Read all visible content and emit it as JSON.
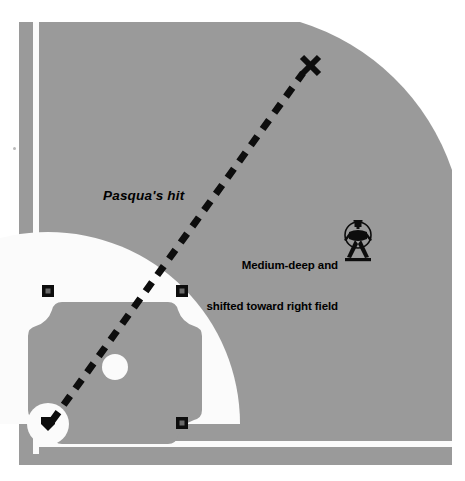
{
  "diagram": {
    "type": "baseball-spray-diagram",
    "width": 465,
    "height": 481
  },
  "colors": {
    "page_background": "#ffffff",
    "field_gray": "#9a9a9a",
    "field_gray_dark": "#949494",
    "chalk_white": "#f5f5f5",
    "dirt_white": "#fbfbfb",
    "ink_black": "#0d0d0d",
    "base_center": "#5a5a5a"
  },
  "labels": {
    "hit": "Pasqua's hit",
    "fielder_position_line1": "Medium-deep and",
    "fielder_position_line2": "shifted toward right field"
  },
  "icons": {
    "fielder": "crouching-fielder-icon",
    "landing_marker": "x-marker-icon"
  },
  "field": {
    "foul_line_left_x": 36,
    "foul_line_bottom_y": 445,
    "outfield_corner_radius": 250,
    "infield_arc_center": [
      48,
      424
    ],
    "infield_arc_radius": 192,
    "mound": {
      "cx": 115,
      "cy": 367,
      "r": 13
    }
  },
  "bases": [
    {
      "name": "home-plate",
      "x": 48,
      "y": 424
    },
    {
      "name": "first-base",
      "x": 182,
      "y": 423
    },
    {
      "name": "second-base",
      "x": 182,
      "y": 291
    },
    {
      "name": "third-base",
      "x": 48,
      "y": 291
    }
  ],
  "trajectory": {
    "name": "pasqua-hit-path",
    "style": "dashed",
    "from": [
      52,
      421
    ],
    "to": [
      303,
      73
    ],
    "landing_marker": [
      310,
      65
    ],
    "dash_pattern": "11 9",
    "stroke_width": 7
  },
  "fielder": {
    "name": "right-fielder",
    "x": 357,
    "y": 240
  }
}
